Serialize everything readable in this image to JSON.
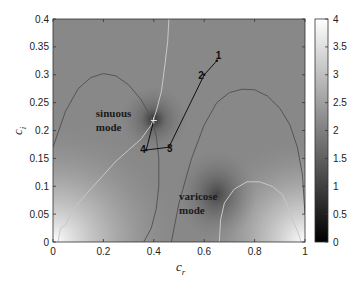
{
  "chart_data": {
    "type": "heatmap",
    "title": "",
    "xlabel": "c",
    "xlabel_subscript": "r",
    "ylabel": "c",
    "ylabel_subscript": "i",
    "xlim": [
      0,
      1
    ],
    "ylim": [
      0,
      0.4
    ],
    "xticks": [
      0,
      0.2,
      0.4,
      0.6,
      0.8,
      1
    ],
    "xtick_labels": [
      "0",
      "0.2",
      "0.4",
      "0.6",
      "0.8",
      "1"
    ],
    "yticks": [
      0,
      0.05,
      0.1,
      0.15,
      0.2,
      0.25,
      0.3,
      0.35,
      0.4
    ],
    "ytick_labels": [
      "0",
      "0.05",
      "0.1",
      "0.15",
      "0.2",
      "0.25",
      "0.3",
      "0.35",
      "0.4"
    ],
    "colormap": "gray",
    "colorbar": {
      "range": [
        0,
        4
      ],
      "ticks": [
        0,
        0.5,
        1,
        1.5,
        2,
        2.5,
        3,
        3.5,
        4
      ],
      "tick_labels": [
        "0",
        "0.5",
        "1",
        "1.5",
        "2",
        "2.5",
        "3",
        "3.5",
        "4"
      ],
      "placement": "right"
    },
    "field_features": [
      {
        "name": "sinuous-mode-minimum",
        "cr": 0.4,
        "ci": 0.22,
        "value": 0.2
      },
      {
        "name": "varicose-mode-minimum",
        "cr": 0.65,
        "ci": 0.085,
        "value": 0.8
      },
      {
        "name": "bright-bottom-left",
        "cr": 0.0,
        "ci": 0.0,
        "value": 4.0
      },
      {
        "name": "bright-bottom-right",
        "cr": 1.0,
        "ci": 0.0,
        "value": 4.0
      },
      {
        "name": "background",
        "value": 2.3
      }
    ],
    "contours": [
      {
        "name": "dark-contour-left-arch",
        "color": "#555555",
        "points": [
          [
            0.0,
            0.17
          ],
          [
            0.05,
            0.235
          ],
          [
            0.1,
            0.275
          ],
          [
            0.15,
            0.295
          ],
          [
            0.2,
            0.302
          ],
          [
            0.25,
            0.298
          ],
          [
            0.3,
            0.282
          ],
          [
            0.35,
            0.255
          ],
          [
            0.39,
            0.222
          ],
          [
            0.41,
            0.19
          ],
          [
            0.42,
            0.15
          ],
          [
            0.42,
            0.1
          ],
          [
            0.41,
            0.06
          ],
          [
            0.39,
            0.025
          ],
          [
            0.36,
            0.0
          ]
        ]
      },
      {
        "name": "dark-contour-right-arch",
        "color": "#555555",
        "points": [
          [
            0.47,
            0.0
          ],
          [
            0.5,
            0.07
          ],
          [
            0.55,
            0.15
          ],
          [
            0.6,
            0.21
          ],
          [
            0.65,
            0.25
          ],
          [
            0.7,
            0.268
          ],
          [
            0.75,
            0.274
          ],
          [
            0.8,
            0.273
          ],
          [
            0.85,
            0.262
          ],
          [
            0.9,
            0.24
          ],
          [
            0.94,
            0.21
          ],
          [
            0.97,
            0.17
          ],
          [
            0.99,
            0.12
          ],
          [
            1.0,
            0.05
          ]
        ]
      },
      {
        "name": "light-contour-left",
        "color": "#c8c8c8",
        "points": [
          [
            0.02,
            0.0
          ],
          [
            0.03,
            0.025
          ],
          [
            0.05,
            0.03
          ],
          [
            0.07,
            0.05
          ],
          [
            0.1,
            0.07
          ],
          [
            0.15,
            0.095
          ],
          [
            0.2,
            0.12
          ],
          [
            0.25,
            0.145
          ],
          [
            0.3,
            0.165
          ],
          [
            0.35,
            0.185
          ],
          [
            0.39,
            0.21
          ],
          [
            0.41,
            0.235
          ],
          [
            0.43,
            0.27
          ],
          [
            0.445,
            0.32
          ],
          [
            0.455,
            0.36
          ],
          [
            0.46,
            0.4
          ]
        ]
      },
      {
        "name": "light-contour-right-loop",
        "color": "#c8c8c8",
        "points": [
          [
            0.66,
            0.0
          ],
          [
            0.665,
            0.04
          ],
          [
            0.68,
            0.07
          ],
          [
            0.72,
            0.095
          ],
          [
            0.77,
            0.108
          ],
          [
            0.82,
            0.108
          ],
          [
            0.87,
            0.1
          ],
          [
            0.91,
            0.085
          ],
          [
            0.93,
            0.065
          ],
          [
            0.95,
            0.04
          ],
          [
            0.97,
            0.02
          ],
          [
            0.985,
            0.0
          ]
        ]
      }
    ],
    "path": {
      "name": "numbered-trajectory",
      "color": "#111111",
      "points": [
        {
          "label": "1",
          "cr": 0.65,
          "ci": 0.325
        },
        {
          "label": "2",
          "cr": 0.6,
          "ci": 0.3
        },
        {
          "label": "3",
          "cr": 0.46,
          "ci": 0.17
        },
        {
          "label": "4",
          "cr": 0.37,
          "ci": 0.165
        },
        {
          "label": "",
          "cr": 0.4,
          "ci": 0.218
        }
      ]
    },
    "annotations": [
      {
        "text_line1": "sinuous",
        "text_line2": "mode",
        "cr": 0.17,
        "ci": 0.225
      },
      {
        "text_line1": "varicose",
        "text_line2": "mode",
        "cr": 0.5,
        "ci": 0.075
      }
    ],
    "grid": false,
    "legend": "none"
  }
}
